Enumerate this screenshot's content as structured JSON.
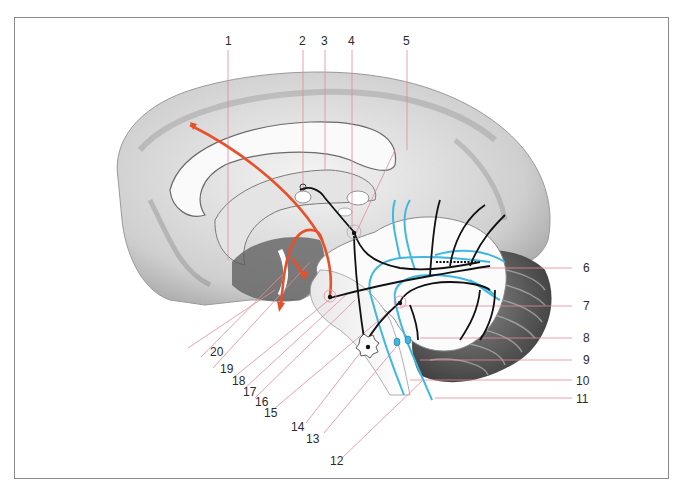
{
  "figure": {
    "type": "anatomical-illustration",
    "colors": {
      "leader_line": "#e58a9a",
      "cortical_pathway": "#e8502a",
      "efferent_pathway": "#111111",
      "afferent_pathway": "#3fb8e0",
      "frame": "#8a8a8a"
    }
  },
  "labels": [
    {
      "id": "1",
      "text": "1"
    },
    {
      "id": "2",
      "text": "2"
    },
    {
      "id": "3",
      "text": "3"
    },
    {
      "id": "4",
      "text": "4"
    },
    {
      "id": "5",
      "text": "5"
    },
    {
      "id": "6",
      "text": "6"
    },
    {
      "id": "7",
      "text": "7"
    },
    {
      "id": "8",
      "text": "8"
    },
    {
      "id": "9",
      "text": "9"
    },
    {
      "id": "10",
      "text": "10"
    },
    {
      "id": "11",
      "text": "11"
    },
    {
      "id": "12",
      "text": "12"
    },
    {
      "id": "13",
      "text": "13"
    },
    {
      "id": "14",
      "text": "14"
    },
    {
      "id": "15",
      "text": "15"
    },
    {
      "id": "16",
      "text": "16"
    },
    {
      "id": "17",
      "text": "17"
    },
    {
      "id": "18",
      "text": "18"
    },
    {
      "id": "19",
      "text": "19"
    },
    {
      "id": "20",
      "text": "20"
    }
  ]
}
